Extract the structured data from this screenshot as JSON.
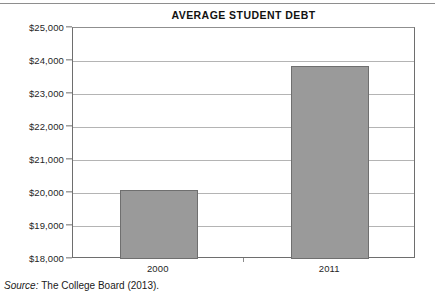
{
  "chart_data": {
    "type": "bar",
    "title": "AVERAGE STUDENT DEBT",
    "xlabel": "",
    "ylabel": "",
    "categories": [
      "2000",
      "2011"
    ],
    "values": [
      20100,
      23850
    ],
    "ylim": [
      18000,
      25000
    ],
    "ytick_step": 1000,
    "ytick_labels": [
      "$25,000",
      "$24,000",
      "$23,000",
      "$22,000",
      "$21,000",
      "$20,000",
      "$19,000",
      "$18,000"
    ],
    "ytick_values": [
      25000,
      24000,
      23000,
      22000,
      21000,
      20000,
      19000,
      18000
    ],
    "grid": true,
    "legend": false,
    "series": [
      {
        "name": "Average student debt",
        "values": [
          20100,
          23850
        ]
      }
    ],
    "colors": {
      "bar_fill": "#9a9a9a",
      "bar_border": "#6f6f6f",
      "gridline": "#b4b4b4",
      "axis": "#6e6e6e",
      "text": "#1a1a1a"
    }
  },
  "source": {
    "label": "Source:",
    "text": "The College Board (2013)."
  }
}
